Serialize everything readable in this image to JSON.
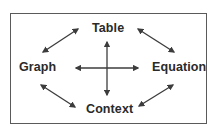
{
  "diagram": {
    "type": "relationship-diagram",
    "nodes": [
      {
        "id": "table",
        "label": "Table",
        "position": "top"
      },
      {
        "id": "graph",
        "label": "Graph",
        "position": "left"
      },
      {
        "id": "equation",
        "label": "Equation",
        "position": "right"
      },
      {
        "id": "context",
        "label": "Context",
        "position": "bottom"
      }
    ],
    "edges": [
      {
        "from": "graph",
        "to": "table",
        "bidirectional": true
      },
      {
        "from": "table",
        "to": "equation",
        "bidirectional": true
      },
      {
        "from": "graph",
        "to": "context",
        "bidirectional": true
      },
      {
        "from": "context",
        "to": "equation",
        "bidirectional": true
      },
      {
        "from": "graph",
        "to": "equation",
        "bidirectional": true
      },
      {
        "from": "table",
        "to": "context",
        "bidirectional": true
      }
    ],
    "colors": {
      "line": "#3c3c3c",
      "text": "#2a2a2a",
      "frame": "#5a5a5a",
      "background": "#ffffff"
    }
  }
}
